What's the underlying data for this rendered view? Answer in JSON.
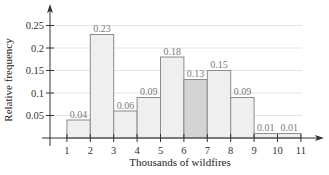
{
  "chart_data": {
    "type": "bar",
    "subtype": "histogram",
    "title": "",
    "xlabel": "Thousands of wildfires",
    "ylabel": "Relative frequency",
    "x_ticks": [
      "1",
      "2",
      "3",
      "4",
      "5",
      "6",
      "7",
      "8",
      "9",
      "10",
      "11"
    ],
    "y_ticks": [
      "0.05",
      "0.1",
      "0.15",
      "0.2",
      "0.25"
    ],
    "xlim": [
      0,
      11.8
    ],
    "ylim": [
      0,
      0.27
    ],
    "grid": "horizontal light lines",
    "bins": [
      {
        "from": 1,
        "to": 2,
        "value": 0.04,
        "label": "0.04",
        "highlight": false
      },
      {
        "from": 2,
        "to": 3,
        "value": 0.23,
        "label": "0.23",
        "highlight": false
      },
      {
        "from": 3,
        "to": 4,
        "value": 0.06,
        "label": "0.06",
        "highlight": false
      },
      {
        "from": 4,
        "to": 5,
        "value": 0.09,
        "label": "0.09",
        "highlight": false
      },
      {
        "from": 5,
        "to": 6,
        "value": 0.18,
        "label": "0.18",
        "highlight": false
      },
      {
        "from": 6,
        "to": 7,
        "value": 0.13,
        "label": "0.13",
        "highlight": true
      },
      {
        "from": 7,
        "to": 8,
        "value": 0.15,
        "label": "0.15",
        "highlight": false
      },
      {
        "from": 8,
        "to": 9,
        "value": 0.09,
        "label": "0.09",
        "highlight": false
      },
      {
        "from": 9,
        "to": 10,
        "value": 0.01,
        "label": "0.01",
        "highlight": false
      },
      {
        "from": 10,
        "to": 11,
        "value": 0.01,
        "label": "0.01",
        "highlight": false
      }
    ],
    "categories": [
      "1-2",
      "2-3",
      "3-4",
      "4-5",
      "5-6",
      "6-7",
      "7-8",
      "8-9",
      "9-10",
      "10-11"
    ],
    "values": [
      0.04,
      0.23,
      0.06,
      0.09,
      0.18,
      0.13,
      0.15,
      0.09,
      0.01,
      0.01
    ]
  },
  "colors": {
    "bar_fill": "#efefef",
    "bar_highlight_fill": "#d4d4d4",
    "bar_stroke": "#8c8c8c",
    "axis": "#333333",
    "grid": "#e3e3e3"
  }
}
